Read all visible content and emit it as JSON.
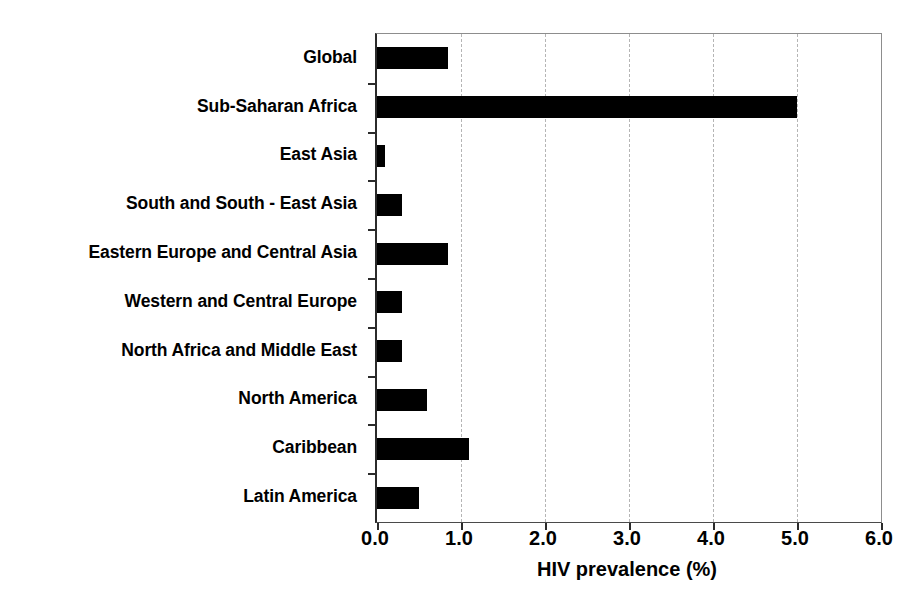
{
  "chart_data": {
    "type": "bar",
    "orientation": "horizontal",
    "title": "",
    "xlabel": "HIV prevalence (%)",
    "ylabel": "",
    "xlim": [
      0.0,
      6.0
    ],
    "xticks": [
      "0.0",
      "1.0",
      "2.0",
      "3.0",
      "4.0",
      "5.0",
      "6.0"
    ],
    "xtick_values": [
      0.0,
      1.0,
      2.0,
      3.0,
      4.0,
      5.0,
      6.0
    ],
    "grid": "vertical-dashed",
    "legend": "none",
    "bar_color": "#000000",
    "categories": [
      "Global",
      "Sub-Saharan Africa",
      "East Asia",
      "South and South - East Asia",
      "Eastern Europe and Central Asia",
      "Western and Central Europe",
      "North Africa and Middle East",
      "North America",
      "Caribbean",
      "Latin America"
    ],
    "values": [
      0.85,
      5.0,
      0.1,
      0.3,
      0.85,
      0.3,
      0.3,
      0.6,
      1.1,
      0.5
    ]
  }
}
